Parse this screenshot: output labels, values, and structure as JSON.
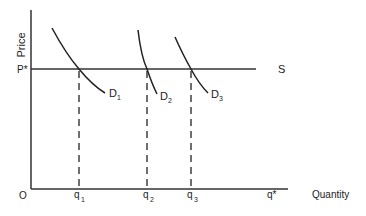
{
  "diagram": {
    "axes": {
      "y_label": "Price",
      "x_label": "Quantity",
      "origin_label": "O"
    },
    "price_level": {
      "label": "P*",
      "supply_label": "S"
    },
    "demand_curves": [
      {
        "label": "D",
        "sub": "1"
      },
      {
        "label": "D",
        "sub": "2"
      },
      {
        "label": "D",
        "sub": "3"
      }
    ],
    "quantity_ticks": [
      {
        "label": "q",
        "sub": "1"
      },
      {
        "label": "q",
        "sub": "2"
      },
      {
        "label": "q",
        "sub": "3"
      },
      {
        "label": "q*",
        "sub": ""
      }
    ],
    "colors": {
      "line": "#222222",
      "background": "#ffffff"
    }
  }
}
